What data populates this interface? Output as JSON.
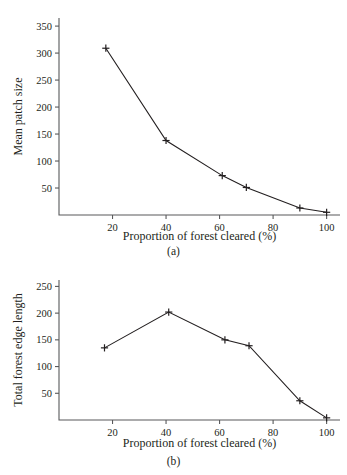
{
  "figure": {
    "panels": [
      {
        "id": "a",
        "caption": "(a)",
        "xlabel": "Proportion of forest cleared (%)",
        "ylabel": "Mean patch size"
      },
      {
        "id": "b",
        "caption": "(b)",
        "xlabel": "Proportion of forest cleared (%)",
        "ylabel": "Total forest edge length"
      }
    ]
  },
  "chart_data": [
    {
      "type": "line",
      "panel": "a",
      "title": "",
      "xlabel": "Proportion of forest cleared (%)",
      "ylabel": "Mean patch size",
      "xlim": [
        0,
        105
      ],
      "ylim": [
        0,
        365
      ],
      "xticks": [
        20,
        40,
        60,
        80,
        100
      ],
      "yticks": [
        50,
        100,
        150,
        200,
        250,
        300,
        350
      ],
      "xtick_labels": [
        "20",
        "40",
        "60",
        "80",
        "100"
      ],
      "ytick_labels": [
        "50",
        "100",
        "150",
        "200",
        "250",
        "300",
        "350"
      ],
      "grid": false,
      "legend": false,
      "marker": "plus",
      "color": "#231f20",
      "x": [
        17.5,
        40,
        61,
        70,
        90,
        100
      ],
      "y": [
        309,
        138,
        73,
        51,
        13,
        5
      ]
    },
    {
      "type": "line",
      "panel": "b",
      "title": "",
      "xlabel": "Proportion of forest cleared (%)",
      "ylabel": "Total forest edge length",
      "xlim": [
        0,
        105
      ],
      "ylim": [
        0,
        262
      ],
      "xticks": [
        20,
        40,
        60,
        80,
        100
      ],
      "yticks": [
        50,
        100,
        150,
        200,
        250
      ],
      "xtick_labels": [
        "20",
        "40",
        "60",
        "80",
        "100"
      ],
      "ytick_labels": [
        "50",
        "100",
        "150",
        "200",
        "250"
      ],
      "grid": false,
      "legend": false,
      "marker": "plus",
      "color": "#231f20",
      "x": [
        17,
        41,
        62,
        71,
        90,
        100
      ],
      "y": [
        135,
        202,
        150,
        139,
        36,
        4
      ]
    }
  ]
}
